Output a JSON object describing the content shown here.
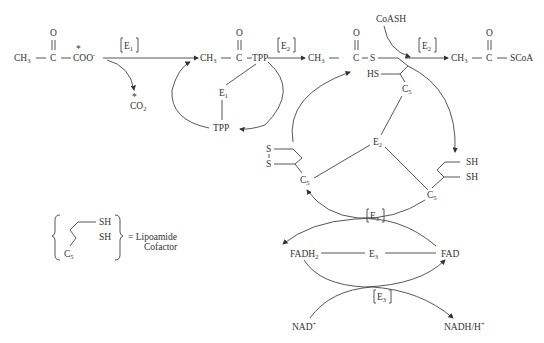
{
  "diagram": {
    "pyruvate": {
      "ch3": "CH",
      "ch3_sub": "3",
      "c": "C",
      "o": "O",
      "coo": "COO",
      "coo_sup": "-",
      "star": "*"
    },
    "co2": {
      "label": "CO",
      "sub": "2",
      "star": "*"
    },
    "e1_bracket": {
      "label": "E",
      "sub": "1"
    },
    "acyl_tpp": {
      "ch3": "CH",
      "ch3_sub": "3",
      "c": "C",
      "o": "O",
      "tpp": "TPP"
    },
    "e1": {
      "label": "E",
      "sub": "1"
    },
    "tpp": "TPP",
    "e2_bracket_a": {
      "label": "E",
      "sub": "2"
    },
    "acetyl_lipoamide": {
      "ch3": "CH",
      "ch3_sub": "3",
      "c": "C",
      "o": "O",
      "s": "S",
      "hs": "HS",
      "c5": "C",
      "c5_sub": "5"
    },
    "coash": "CoASH",
    "e2_bracket_b": {
      "label": "E",
      "sub": "2"
    },
    "acetyl_coa": {
      "ch3": "CH",
      "ch3_sub": "3",
      "c": "C",
      "o": "O",
      "scoa": "SCoA"
    },
    "e2_center": {
      "label": "E",
      "sub": "2"
    },
    "oxidized_lipoamide": {
      "s1": "S",
      "s2": "S",
      "c5": "C",
      "c5_sub": "5"
    },
    "reduced_lipoamide": {
      "sh1": "SH",
      "sh2": "SH",
      "c5": "C",
      "c5_sub": "5"
    },
    "e3_bracket_a": {
      "label": "E",
      "sub": "3"
    },
    "fadh2": {
      "label": "FADH",
      "sub": "2"
    },
    "e3_center": {
      "label": "E",
      "sub": "3"
    },
    "fad": "FAD",
    "e3_bracket_b": {
      "label": "E",
      "sub": "3"
    },
    "nad": {
      "label": "NAD",
      "sup": "+"
    },
    "nadh": {
      "label": "NADH/H",
      "sup": "+"
    },
    "legend": {
      "sh1": "SH",
      "sh2": "SH",
      "c5": "C",
      "c5_sub": "5",
      "eq": "= Lipoamide",
      "line2": "Cofactor"
    }
  }
}
